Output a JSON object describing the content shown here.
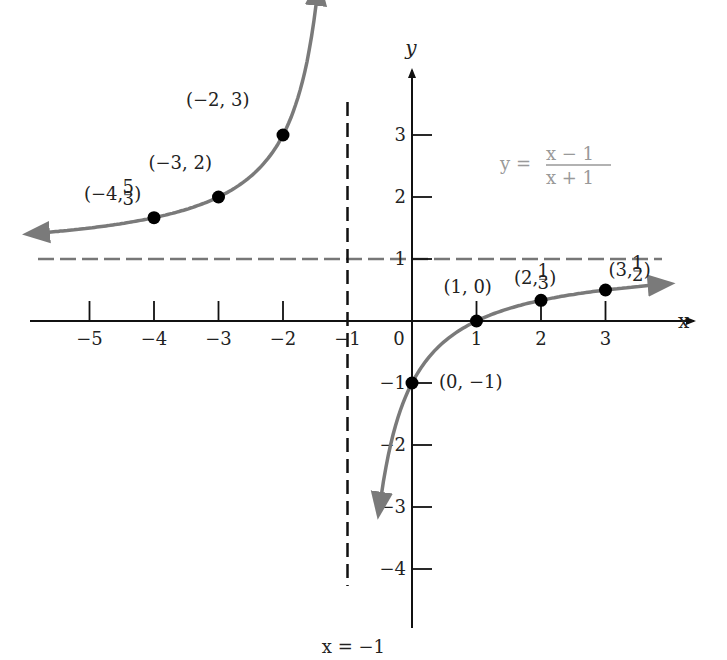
{
  "chart_data": {
    "type": "line",
    "title": "",
    "function": "y = (x - 1)/(x + 1)",
    "formula": {
      "lhs": "y =",
      "numerator": "x − 1",
      "denominator": "x + 1"
    },
    "xlabel": "x",
    "ylabel": "y",
    "xlim": [
      -5.8,
      4.1
    ],
    "ylim": [
      -5.0,
      4.2
    ],
    "x_ticks": [
      {
        "value": -5,
        "label": "−5"
      },
      {
        "value": -4,
        "label": "−4"
      },
      {
        "value": -3,
        "label": "−3"
      },
      {
        "value": -2,
        "label": "−2"
      },
      {
        "value": -1,
        "label": "−1"
      },
      {
        "value": 0,
        "label": "0"
      },
      {
        "value": 1,
        "label": "1"
      },
      {
        "value": 2,
        "label": "2"
      },
      {
        "value": 3,
        "label": "3"
      }
    ],
    "y_ticks": [
      {
        "value": 3,
        "label": "3"
      },
      {
        "value": 2,
        "label": "2"
      },
      {
        "value": 1,
        "label": "1"
      },
      {
        "value": -1,
        "label": "−1"
      },
      {
        "value": -2,
        "label": "−2"
      },
      {
        "value": -3,
        "label": "−3"
      },
      {
        "value": -4,
        "label": "−4"
      }
    ],
    "asymptotes": {
      "vertical": {
        "x": -1,
        "label": "x = −1"
      },
      "horizontal": {
        "y": 1
      }
    },
    "branches": [
      {
        "name": "left-branch",
        "x_range": [
          -5.7,
          -1.45
        ]
      },
      {
        "name": "right-branch",
        "x_range": [
          -0.48,
          4.0
        ]
      }
    ],
    "points": [
      {
        "x": -4,
        "y": 1.6667,
        "label": "(−4, 5/3)",
        "label_main": "(−4, ",
        "frac_num": "5",
        "frac_den": "3",
        "label_end": ")"
      },
      {
        "x": -3,
        "y": 2,
        "label": "(−3, 2)"
      },
      {
        "x": -2,
        "y": 3,
        "label": "(−2, 3)"
      },
      {
        "x": 0,
        "y": -1,
        "label": "(0, −1)"
      },
      {
        "x": 1,
        "y": 0,
        "label": "(1, 0)"
      },
      {
        "x": 2,
        "y": 0.3333,
        "label": "(2, 1/3)",
        "label_main": "(2, ",
        "frac_num": "1",
        "frac_den": "3",
        "label_end": ")"
      },
      {
        "x": 3,
        "y": 0.5,
        "label": "(3, 1/2)",
        "label_main": "(3, ",
        "frac_num": "1",
        "frac_den": "2",
        "label_end": ")"
      }
    ],
    "grid": false,
    "colors": {
      "curve": "#7a7a7a",
      "axes": "#111111",
      "asymptote": "#777777",
      "points": "#000000"
    }
  }
}
